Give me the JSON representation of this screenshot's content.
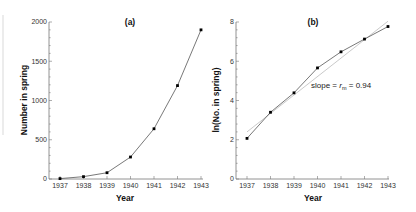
{
  "chart_data": [
    {
      "type": "line",
      "panel_label": "(a)",
      "title": "(a)",
      "xlabel": "Year",
      "ylabel": "Number in spring",
      "categories": [
        "1937",
        "1938",
        "1939",
        "1940",
        "1941",
        "1942",
        "1943"
      ],
      "x": [
        1937,
        1938,
        1939,
        1940,
        1941,
        1942,
        1943
      ],
      "values": [
        5,
        30,
        80,
        280,
        640,
        1190,
        1900
      ],
      "ylim": [
        0,
        2000
      ],
      "yticks": [
        0,
        500,
        1000,
        1500,
        2000
      ],
      "ytick_labels": [
        "0",
        "500",
        "1000",
        "1500",
        "2000"
      ],
      "grid": false,
      "legend": null
    },
    {
      "type": "line",
      "panel_label": "(b)",
      "title": "(b)",
      "xlabel": "Year",
      "ylabel": "ln(No. in spring)",
      "categories": [
        "1937",
        "1938",
        "1939",
        "1940",
        "1941",
        "1942",
        "1943"
      ],
      "x": [
        1937,
        1938,
        1939,
        1940,
        1941,
        1942,
        1943
      ],
      "series": [
        {
          "name": "ln(No. in spring)",
          "values": [
            2.07,
            3.4,
            4.39,
            5.66,
            6.48,
            7.13,
            7.77
          ]
        },
        {
          "name": "fitted line",
          "values": [
            2.4,
            3.34,
            4.28,
            5.22,
            6.16,
            7.1,
            8.04
          ]
        }
      ],
      "annotation": "slope = r_m = 0.94",
      "slope": 0.94,
      "ylim": [
        0,
        8
      ],
      "yticks": [
        0,
        2,
        4,
        6,
        8
      ],
      "ytick_labels": [
        "0",
        "2",
        "4",
        "6",
        "8"
      ],
      "grid": false,
      "legend": null
    }
  ],
  "panel_a": {
    "label": "(a)",
    "xlabel": "Year",
    "ylabel": "Number in spring",
    "xticks": [
      "1937",
      "1938",
      "1939",
      "1940",
      "1941",
      "1942",
      "1943"
    ],
    "yticks": [
      "0",
      "500",
      "1000",
      "1500",
      "2000"
    ]
  },
  "panel_b": {
    "label": "(b)",
    "xlabel": "Year",
    "ylabel": "ln(No. in spring)",
    "xticks": [
      "1937",
      "1938",
      "1939",
      "1940",
      "1941",
      "1942",
      "1943"
    ],
    "yticks": [
      "0",
      "2",
      "4",
      "6",
      "8"
    ],
    "annotation_prefix": "slope = ",
    "annotation_r": "r",
    "annotation_sub": "m",
    "annotation_suffix": " = 0.94"
  },
  "colors": {
    "data_line": "#555555",
    "fit_line": "#bbbbbb",
    "marker": "#000000",
    "axis": "#777777"
  }
}
